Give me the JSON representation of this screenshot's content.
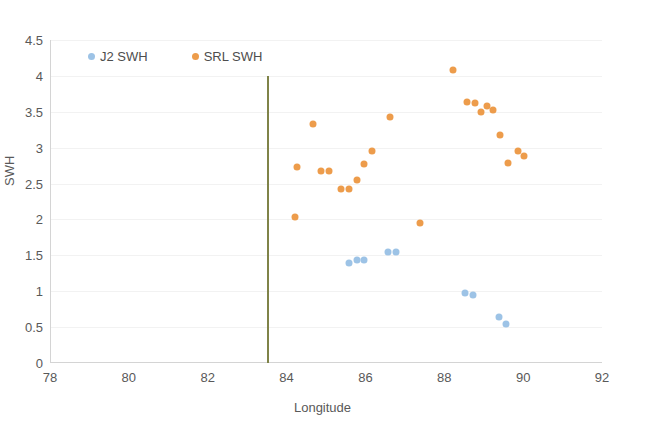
{
  "chart_data": {
    "type": "scatter",
    "title": "",
    "xlabel": "Longitude",
    "ylabel": "SWH",
    "xlim": [
      78,
      92
    ],
    "ylim": [
      0,
      4.5
    ],
    "xticks": [
      78,
      80,
      82,
      84,
      86,
      88,
      90,
      92
    ],
    "yticks": [
      0,
      0.5,
      1,
      1.5,
      2,
      2.5,
      3,
      3.5,
      4,
      4.5
    ],
    "grid": true,
    "legend_position": "top-left",
    "colors": {
      "j2_swh": "#9DC3E6",
      "srl_swh": "#ED9C4B",
      "vertical_line": "#7F8348",
      "axis_text": "#595959",
      "gridline": "#F2F2F2"
    },
    "annotations": [
      {
        "name": "vertical-reference-line",
        "type": "vline",
        "x": 83.5,
        "y_start": 0,
        "y_end": 4.0,
        "color": "#7F8348"
      }
    ],
    "series": [
      {
        "name": "J2 SWH",
        "color": "#9DC3E6",
        "marker": "circle",
        "points": [
          [
            85.55,
            1.4
          ],
          [
            85.75,
            1.43
          ],
          [
            85.95,
            1.43
          ],
          [
            86.55,
            1.55
          ],
          [
            86.75,
            1.55
          ],
          [
            88.5,
            0.97
          ],
          [
            88.7,
            0.95
          ],
          [
            89.35,
            0.64
          ],
          [
            89.55,
            0.55
          ]
        ]
      },
      {
        "name": "SRL SWH",
        "color": "#ED9C4B",
        "marker": "circle",
        "points": [
          [
            84.2,
            2.03
          ],
          [
            84.25,
            2.73
          ],
          [
            84.65,
            3.33
          ],
          [
            84.85,
            2.68
          ],
          [
            85.05,
            2.68
          ],
          [
            85.35,
            2.42
          ],
          [
            85.55,
            2.42
          ],
          [
            85.75,
            2.55
          ],
          [
            85.95,
            2.77
          ],
          [
            86.15,
            2.95
          ],
          [
            86.6,
            3.43
          ],
          [
            87.35,
            1.95
          ],
          [
            88.2,
            4.08
          ],
          [
            88.55,
            3.63
          ],
          [
            88.75,
            3.62
          ],
          [
            88.9,
            3.5
          ],
          [
            89.05,
            3.58
          ],
          [
            89.2,
            3.52
          ],
          [
            89.4,
            3.18
          ],
          [
            89.6,
            2.78
          ],
          [
            89.85,
            2.95
          ],
          [
            90.0,
            2.88
          ]
        ]
      }
    ]
  },
  "legend": {
    "items": [
      {
        "label": "J2 SWH",
        "color": "#9DC3E6"
      },
      {
        "label": "SRL SWH",
        "color": "#ED9C4B"
      }
    ]
  },
  "axes": {
    "x_title": "Longitude",
    "y_title": "SWH"
  }
}
